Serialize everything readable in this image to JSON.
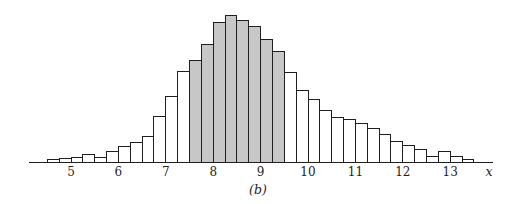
{
  "figure": {
    "caption": "(b)",
    "background": "#ffffff"
  },
  "chart_data": {
    "type": "bar",
    "subtype": "histogram",
    "title": "",
    "xlabel": "x",
    "ylabel": "",
    "grid": false,
    "legend": false,
    "bin_width": 0.25,
    "x_axis_range": [
      4.3,
      13.75
    ],
    "xticks": [
      "5",
      "6",
      "7",
      "8",
      "9",
      "10",
      "11",
      "12",
      "13"
    ],
    "shaded_interval": [
      7.5,
      9.5
    ],
    "units_note": "no y-axis shown; heights are relative (screen px)",
    "colors": {
      "bar_fill": "#ffffff",
      "shaded_fill": "#c7c7c7",
      "stroke": "#1f1f1f",
      "axis": "#1f1f1f"
    },
    "bins": {
      "x0": [
        4.5,
        4.75,
        5.0,
        5.25,
        5.5,
        5.75,
        6.0,
        6.25,
        6.5,
        6.75,
        7.0,
        7.25,
        7.5,
        7.75,
        8.0,
        8.25,
        8.5,
        8.75,
        9.0,
        9.25,
        9.5,
        9.75,
        10.0,
        10.25,
        10.5,
        10.75,
        11.0,
        11.25,
        11.5,
        11.75,
        12.0,
        12.25,
        12.5,
        12.75,
        13.0,
        13.25
      ],
      "heights": [
        3,
        4,
        5,
        8,
        5,
        11,
        16,
        20,
        26,
        46,
        66,
        91,
        102,
        118,
        140,
        147,
        142,
        136,
        123,
        111,
        90,
        72,
        63,
        52,
        45,
        43,
        39,
        34,
        28,
        21,
        17,
        13,
        6,
        11,
        6,
        3
      ],
      "shaded": [
        false,
        false,
        false,
        false,
        false,
        false,
        false,
        false,
        false,
        false,
        false,
        false,
        true,
        true,
        true,
        true,
        true,
        true,
        true,
        true,
        false,
        false,
        false,
        false,
        false,
        false,
        false,
        false,
        false,
        false,
        false,
        false,
        false,
        false,
        false,
        false
      ]
    }
  }
}
